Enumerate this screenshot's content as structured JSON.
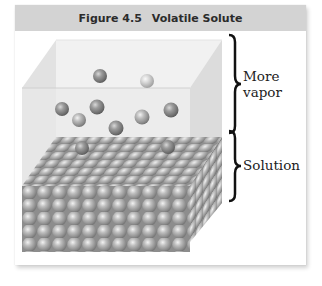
{
  "figure": {
    "number": "Figure 4.5",
    "title": "Volatile Solute"
  },
  "labels": {
    "vapor_line1": "More",
    "vapor_line2": "vapor",
    "solution": "Solution"
  },
  "colors": {
    "header_bg": "#d3d3d3",
    "header_text": "#2b2b2b",
    "glass": "#e6e6e6",
    "sphere": "#9a9a9a",
    "brace": "#111111"
  },
  "vapor_particles": [
    {
      "x": 100,
      "y": 76,
      "shade": "dark"
    },
    {
      "x": 147,
      "y": 81,
      "shade": "light"
    },
    {
      "x": 62,
      "y": 109,
      "shade": "dark"
    },
    {
      "x": 97,
      "y": 107,
      "shade": "dark"
    },
    {
      "x": 79,
      "y": 120,
      "shade": "medium"
    },
    {
      "x": 142,
      "y": 117,
      "shade": "medium"
    },
    {
      "x": 171,
      "y": 110,
      "shade": "dark"
    },
    {
      "x": 116,
      "y": 128,
      "shade": "dark"
    }
  ]
}
